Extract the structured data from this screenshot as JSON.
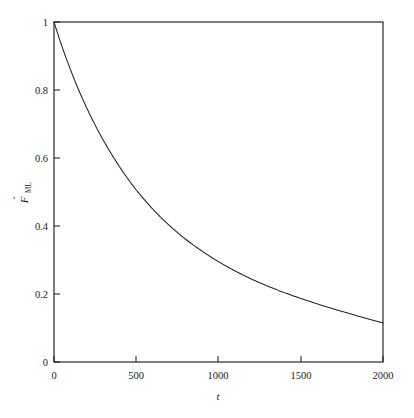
{
  "figure": {
    "background_color": "#ffffff",
    "frame_color": "#1f1f1f",
    "curve_color": "#222222"
  },
  "axes": {
    "x_title": "t",
    "y_title_main": "F",
    "y_title_sub": "ML",
    "y_title_accent": "hat"
  },
  "ticks": {
    "x": [
      "0",
      "500",
      "1000",
      "1500",
      "2000"
    ],
    "y": [
      "0",
      "0.2",
      "0.4",
      "0.6",
      "0.8",
      "1"
    ]
  },
  "chart_data": {
    "type": "line",
    "title": "",
    "xlabel": "t",
    "ylabel": "F_ML (hat)",
    "xlim": [
      0,
      2000
    ],
    "ylim": [
      0,
      1
    ],
    "grid": false,
    "legend": "none",
    "xticks": [
      0,
      500,
      1000,
      1500,
      2000
    ],
    "yticks": [
      0,
      0.2,
      0.4,
      0.6,
      0.8,
      1
    ],
    "series": [
      {
        "name": "F_ML estimate",
        "color": "#222222",
        "x": [
          0,
          25,
          50,
          75,
          100,
          150,
          200,
          250,
          300,
          350,
          400,
          450,
          500,
          550,
          600,
          650,
          700,
          750,
          800,
          850,
          900,
          950,
          1000,
          1100,
          1200,
          1300,
          1400,
          1500,
          1600,
          1700,
          1800,
          1900,
          2000
        ],
        "y": [
          1.0,
          0.962,
          0.926,
          0.892,
          0.86,
          0.8,
          0.746,
          0.697,
          0.652,
          0.611,
          0.573,
          0.538,
          0.506,
          0.477,
          0.45,
          0.425,
          0.402,
          0.381,
          0.361,
          0.343,
          0.326,
          0.31,
          0.295,
          0.268,
          0.244,
          0.223,
          0.204,
          0.187,
          0.171,
          0.156,
          0.142,
          0.128,
          0.115
        ]
      }
    ]
  }
}
